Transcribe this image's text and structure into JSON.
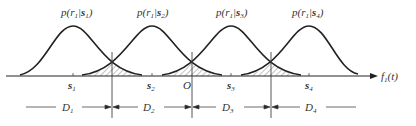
{
  "diagram": {
    "densities": [
      {
        "label_prefix": "p(r",
        "sub_r": "1",
        "mid": "|",
        "s": "s",
        "sub_s": "1",
        "close": ")",
        "center_x": 73
      },
      {
        "label_prefix": "p(r",
        "sub_r": "1",
        "mid": "|",
        "s": "s",
        "sub_s": "2",
        "close": ")",
        "center_x": 152
      },
      {
        "label_prefix": "p(r",
        "sub_r": "1",
        "mid": "|",
        "s": "s",
        "sub_s": "3",
        "close": ")",
        "center_x": 231
      },
      {
        "label_prefix": "p(r",
        "sub_r": "1",
        "mid": "|",
        "s": "s",
        "sub_s": "4",
        "close": ")",
        "center_x": 309
      }
    ],
    "points": [
      {
        "name": "s",
        "sub": "1"
      },
      {
        "name": "s",
        "sub": "2"
      },
      {
        "name": "O",
        "sub": ""
      },
      {
        "name": "s",
        "sub": "3"
      },
      {
        "name": "s",
        "sub": "4"
      }
    ],
    "axis_label": {
      "f": "f",
      "sub": "1",
      "arg": "(t)"
    },
    "regions": [
      {
        "name": "D",
        "sub": "1"
      },
      {
        "name": "D",
        "sub": "2"
      },
      {
        "name": "D",
        "sub": "3"
      },
      {
        "name": "D",
        "sub": "4"
      }
    ],
    "colors": {
      "line": "#222222",
      "text": "#333333",
      "hatch": "#555555"
    }
  }
}
